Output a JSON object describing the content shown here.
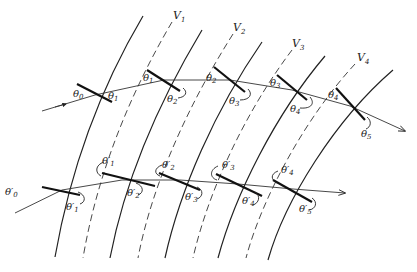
{
  "figure": {
    "layer_labels": [
      "V1",
      "V2",
      "V3",
      "V4"
    ],
    "upper_ray": {
      "angle_labels": [
        {
          "sym": "θ",
          "sub": "0",
          "prime": false
        },
        {
          "sym": "θ",
          "sub": "1",
          "prime": false
        },
        {
          "sym": "θ",
          "sub": "1",
          "prime": false
        },
        {
          "sym": "θ",
          "sub": "2",
          "prime": false
        },
        {
          "sym": "θ",
          "sub": "2",
          "prime": false
        },
        {
          "sym": "θ",
          "sub": "3",
          "prime": false
        },
        {
          "sym": "θ",
          "sub": "3",
          "prime": false
        },
        {
          "sym": "θ",
          "sub": "4",
          "prime": false
        },
        {
          "sym": "θ",
          "sub": "4",
          "prime": false
        },
        {
          "sym": "θ",
          "sub": "5",
          "prime": false
        }
      ]
    },
    "lower_ray": {
      "angle_labels": [
        {
          "sym": "θ",
          "sub": "0",
          "prime": true
        },
        {
          "sym": "θ",
          "sub": "1",
          "prime": true
        },
        {
          "sym": "θ",
          "sub": "1",
          "prime": true
        },
        {
          "sym": "θ",
          "sub": "2",
          "prime": true
        },
        {
          "sym": "θ",
          "sub": "2",
          "prime": true
        },
        {
          "sym": "θ",
          "sub": "3",
          "prime": true
        },
        {
          "sym": "θ",
          "sub": "3",
          "prime": true
        },
        {
          "sym": "θ",
          "sub": "4",
          "prime": true
        },
        {
          "sym": "θ",
          "sub": "4",
          "prime": true
        },
        {
          "sym": "θ",
          "sub": "5",
          "prime": true
        }
      ]
    }
  },
  "labels": {
    "V1": "V",
    "V1_sub": "1",
    "V2": "V",
    "V2_sub": "2",
    "V3": "V",
    "V3_sub": "3",
    "V4": "V",
    "V4_sub": "4",
    "u_t0": "θ",
    "u_t0_sub": "0",
    "u_t1a": "θ",
    "u_t1a_sub": "1",
    "u_t1b": "θ",
    "u_t1b_sub": "1",
    "u_t2a": "θ",
    "u_t2a_sub": "2",
    "u_t2b": "θ",
    "u_t2b_sub": "2",
    "u_t3a": "θ",
    "u_t3a_sub": "3",
    "u_t3b": "θ",
    "u_t3b_sub": "3",
    "u_t4a": "θ",
    "u_t4a_sub": "4",
    "u_t4b": "θ",
    "u_t4b_sub": "4",
    "u_t5": "θ",
    "u_t5_sub": "5",
    "l_t0": "θ′",
    "l_t0_sub": "0",
    "l_t1a": "θ′",
    "l_t1a_sub": "1",
    "l_t1b": "θ′",
    "l_t1b_sub": "1",
    "l_t2a": "θ′",
    "l_t2a_sub": "2",
    "l_t2b": "θ′",
    "l_t2b_sub": "2",
    "l_t3a": "θ′",
    "l_t3a_sub": "3",
    "l_t3b": "θ′",
    "l_t3b_sub": "3",
    "l_t4a": "θ′",
    "l_t4a_sub": "4",
    "l_t4b": "θ′",
    "l_t4b_sub": "4",
    "l_t5": "θ′",
    "l_t5_sub": "5"
  }
}
